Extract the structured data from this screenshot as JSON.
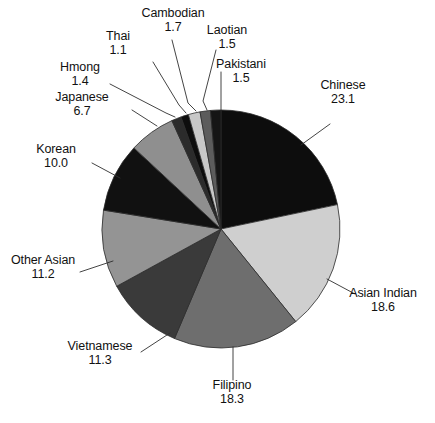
{
  "chart_data": {
    "type": "pie",
    "title": "",
    "subtitle": "",
    "xlabel": "",
    "ylabel": "",
    "units": "percent",
    "legend_position": "none",
    "labels_position": "outside-with-leader-lines",
    "grid": false,
    "total": 105.4,
    "start_angle_deg": 0,
    "direction": "clockwise",
    "categories": [
      "Chinese",
      "Asian Indian",
      "Filipino",
      "Vietnamese",
      "Other Asian",
      "Korean",
      "Japanese",
      "Hmong",
      "Thai",
      "Cambodian",
      "Laotian",
      "Pakistani"
    ],
    "values": [
      23.1,
      18.6,
      18.3,
      11.3,
      11.2,
      10.0,
      6.7,
      1.4,
      1.1,
      1.7,
      1.5,
      1.5
    ],
    "slice_colors": [
      "#0d0d0d",
      "#cfcfcf",
      "#6e6e6e",
      "#3a3a3a",
      "#949494",
      "#111111",
      "#8f8f8f",
      "#2b2b2b",
      "#0d0d0d",
      "#c8c8c8",
      "#5c5c5c",
      "#151515"
    ],
    "slice_stroke": "#2b2b2b",
    "slices": [
      {
        "label": "Chinese",
        "value": 23.1,
        "display_value": "23.1",
        "color": "#0d0d0d"
      },
      {
        "label": "Asian Indian",
        "value": 18.6,
        "display_value": "18.6",
        "color": "#cfcfcf"
      },
      {
        "label": "Filipino",
        "value": 18.3,
        "display_value": "18.3",
        "color": "#6e6e6e"
      },
      {
        "label": "Vietnamese",
        "value": 11.3,
        "display_value": "11.3",
        "color": "#3a3a3a"
      },
      {
        "label": "Other Asian",
        "value": 11.2,
        "display_value": "11.2",
        "color": "#949494"
      },
      {
        "label": "Korean",
        "value": 10.0,
        "display_value": "10.0",
        "color": "#111111"
      },
      {
        "label": "Japanese",
        "value": 6.7,
        "display_value": "6.7",
        "color": "#8f8f8f"
      },
      {
        "label": "Hmong",
        "value": 1.4,
        "display_value": "1.4",
        "color": "#2b2b2b"
      },
      {
        "label": "Thai",
        "value": 1.1,
        "display_value": "1.1",
        "color": "#0d0d0d"
      },
      {
        "label": "Cambodian",
        "value": 1.7,
        "display_value": "1.7",
        "color": "#c8c8c8"
      },
      {
        "label": "Laotian",
        "value": 1.5,
        "display_value": "1.5",
        "color": "#5c5c5c"
      },
      {
        "label": "Pakistani",
        "value": 1.5,
        "display_value": "1.5",
        "color": "#151515"
      }
    ]
  },
  "callouts": {
    "chinese": {
      "cat": "Chinese",
      "val": "23.1"
    },
    "asian_indian": {
      "cat": "Asian Indian",
      "val": "18.6"
    },
    "filipino": {
      "cat": "Filipino",
      "val": "18.3"
    },
    "vietnamese": {
      "cat": "Vietnamese",
      "val": "11.3"
    },
    "other_asian": {
      "cat": "Other Asian",
      "val": "11.2"
    },
    "korean": {
      "cat": "Korean",
      "val": "10.0"
    },
    "japanese": {
      "cat": "Japanese",
      "val": "6.7"
    },
    "hmong": {
      "cat": "Hmong",
      "val": "1.4"
    },
    "thai": {
      "cat": "Thai",
      "val": "1.1"
    },
    "cambodian": {
      "cat": "Cambodian",
      "val": "1.7"
    },
    "laotian": {
      "cat": "Laotian",
      "val": "1.5"
    },
    "pakistani": {
      "cat": "Pakistani",
      "val": "1.5"
    }
  },
  "footnote": {
    "text": ""
  }
}
